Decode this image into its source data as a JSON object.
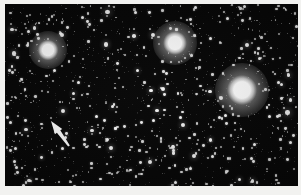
{
  "figure": {
    "kind": "astronomical-photograph",
    "width": 301,
    "height": 195,
    "frame_color": "#f2f2f0",
    "sky_color": "#050505",
    "star_color": "#ffffff",
    "annotation_color": "#ffffff",
    "caption": ""
  },
  "plate": {
    "left": 5,
    "top": 4,
    "width": 293,
    "height": 182
  },
  "bright_stars": [
    {
      "name": "bright-star-left",
      "cx": 43,
      "cy": 46,
      "core_radius": 6.5,
      "halo_radius": 19,
      "peak_brightness": 1.0,
      "label": ""
    },
    {
      "name": "bright-star-top-center",
      "cx": 170,
      "cy": 39,
      "core_radius": 7.5,
      "halo_radius": 22,
      "peak_brightness": 1.0,
      "label": ""
    },
    {
      "name": "bright-star-right",
      "cx": 237,
      "cy": 86,
      "core_radius": 9.5,
      "halo_radius": 27,
      "peak_brightness": 1.0,
      "label": ""
    }
  ],
  "arrow_annotation": {
    "name": "target-arrow",
    "tip_x": 46,
    "tip_y": 117,
    "tail_x": 64,
    "tail_y": 142,
    "color": "#ffffff",
    "shaft_width": 4.2,
    "head_length": 13,
    "head_width": 9,
    "direction": "northwest",
    "meaning": "points to marked object"
  },
  "star_field": {
    "seed": 20240517,
    "count": 1250,
    "min_radius": 0.35,
    "max_radius": 1.55,
    "min_opacity": 0.1,
    "max_opacity": 0.98,
    "medium_star_count": 46,
    "medium_min_radius": 1.4,
    "medium_max_radius": 2.3
  },
  "chart_data": {
    "type": "scatter",
    "xlabel": "",
    "ylabel": "",
    "xlim": [
      0,
      293
    ],
    "ylim": [
      0,
      182
    ],
    "grid": false,
    "legend": null,
    "series": [
      {
        "name": "bright stars",
        "points": [
          {
            "x": 43,
            "y": 46,
            "magnitude": 1.0
          },
          {
            "x": 170,
            "y": 39,
            "magnitude": 0.9
          },
          {
            "x": 237,
            "y": 86,
            "magnitude": 0.8
          }
        ]
      },
      {
        "name": "field stars",
        "points": "procedurally distributed, ~1250 faint points"
      }
    ],
    "annotations": [
      {
        "type": "arrow",
        "from": [
          64,
          142
        ],
        "to": [
          46,
          117
        ],
        "text": ""
      }
    ]
  }
}
